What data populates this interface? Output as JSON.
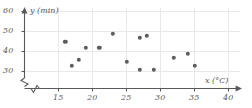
{
  "chart_data": {
    "type": "scatter",
    "title": "",
    "xlabel": "x (°C)",
    "ylabel": "y (min)",
    "xlim": [
      12,
      40
    ],
    "ylim": [
      26,
      60
    ],
    "xticks": [
      15,
      20,
      25,
      30,
      35,
      40
    ],
    "yticks": [
      30,
      40,
      50,
      60
    ],
    "grid": true,
    "axis_break_x": true,
    "axis_break_y": true,
    "legend": "none",
    "point_color": "#5c5c61",
    "axis_color": "#59595c",
    "grid_color": "#e8e8ea",
    "points": [
      {
        "x": 16,
        "y": 45
      },
      {
        "x": 17,
        "y": 33
      },
      {
        "x": 18,
        "y": 36
      },
      {
        "x": 19,
        "y": 42
      },
      {
        "x": 21,
        "y": 42
      },
      {
        "x": 23,
        "y": 49
      },
      {
        "x": 25,
        "y": 35
      },
      {
        "x": 27,
        "y": 47
      },
      {
        "x": 27,
        "y": 31
      },
      {
        "x": 28,
        "y": 48
      },
      {
        "x": 29,
        "y": 31
      },
      {
        "x": 32,
        "y": 37
      },
      {
        "x": 34,
        "y": 39
      },
      {
        "x": 35,
        "y": 33
      }
    ]
  }
}
